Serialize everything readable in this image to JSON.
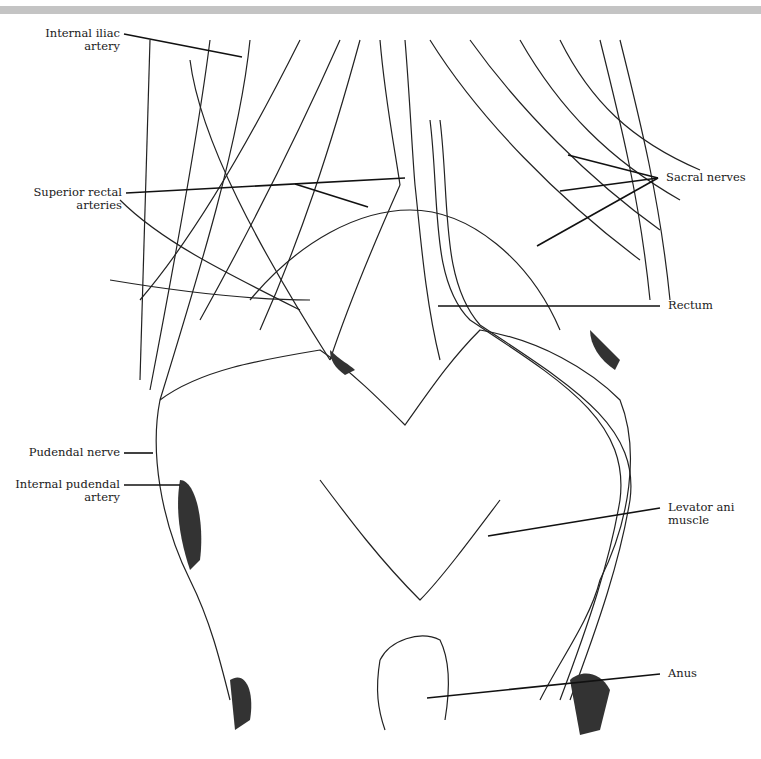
{
  "figure": {
    "type": "anatomical illustration",
    "topbar_color": "#c4c4c4",
    "line_color": "#111111"
  },
  "labels": {
    "internal_iliac": {
      "line1": "Internal iliac",
      "line2": "artery"
    },
    "superior_rectal": {
      "line1": "Superior rectal",
      "line2": "arteries"
    },
    "sacral_nerves": {
      "line1": "Sacral nerves"
    },
    "rectum": {
      "line1": "Rectum"
    },
    "pudendal_nerve": {
      "line1": "Pudendal nerve"
    },
    "internal_pudendal": {
      "line1": "Internal pudendal",
      "line2": "artery"
    },
    "levator_ani": {
      "line1": "Levator ani",
      "line2": "muscle"
    },
    "anus": {
      "line1": "Anus"
    }
  }
}
